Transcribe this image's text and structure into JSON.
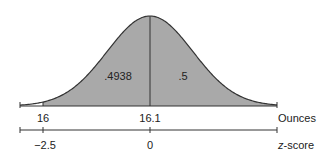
{
  "chart_data": {
    "type": "area",
    "title": "",
    "mean": 16.1,
    "areas": [
      {
        "label": ".4938",
        "from_z": -2.5,
        "to_z": 0
      },
      {
        "label": ".5",
        "from_z": 0,
        "to_z": "inf"
      }
    ],
    "axes": [
      {
        "name": "Ounces",
        "ticks": [
          {
            "value": 16,
            "label": "16"
          },
          {
            "value": 16.1,
            "label": "16.1"
          }
        ]
      },
      {
        "name": "z-score",
        "ticks": [
          {
            "value": -2.5,
            "label": "−2.5"
          },
          {
            "value": 0,
            "label": "0"
          }
        ]
      }
    ],
    "colors": {
      "shade": "#a9a9a9",
      "line": "#333333"
    }
  },
  "labels": {
    "area_left": ".4938",
    "area_right": ".5",
    "ounces_16": "16",
    "ounces_mean": "16.1",
    "ounces_axis": "Ounces",
    "z_left": "−2.5",
    "z_mean": "0",
    "z_axis_prefix": "z",
    "z_axis_suffix": "-score"
  }
}
